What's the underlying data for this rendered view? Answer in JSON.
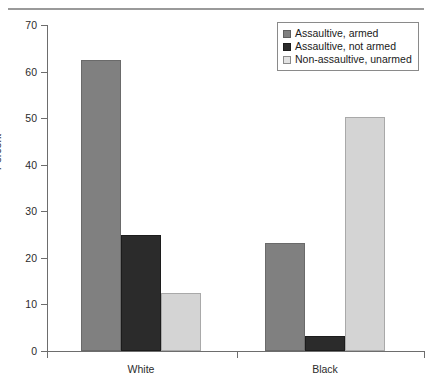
{
  "chart_data": {
    "type": "bar",
    "title": "",
    "subtitle": "",
    "xlabel": "",
    "ylabel": "Percent",
    "categories": [
      "White",
      "Black"
    ],
    "series": [
      {
        "name": "Assaultive, armed",
        "color": "#808080",
        "values": [
          62.5,
          23.3
        ]
      },
      {
        "name": "Assaultive, not armed",
        "color": "#2b2b2b",
        "values": [
          25.0,
          3.2
        ]
      },
      {
        "name": "Non-assaultive, unarmed",
        "color": "#d4d4d4",
        "values": [
          12.5,
          50.3
        ]
      }
    ],
    "ylim": [
      0,
      70
    ],
    "ytick_step": 10,
    "ytick_labels": [
      "0",
      "10",
      "20",
      "30",
      "40",
      "50",
      "60",
      "70"
    ],
    "grid": false,
    "legend_position": "top-right",
    "annotations": []
  },
  "axes": {
    "y_title": "Percent",
    "y_ticks": [
      "70",
      "60",
      "50",
      "40",
      "30",
      "20",
      "10",
      "0"
    ],
    "x_categories": [
      "White",
      "Black"
    ]
  },
  "legend": {
    "entries": [
      {
        "label": "Assaultive, armed"
      },
      {
        "label": "Assaultive, not armed"
      },
      {
        "label": "Non-assaultive, unarmed"
      }
    ]
  },
  "colors": {
    "series_armed": "#808080",
    "series_not_armed": "#2b2b2b",
    "series_unarmed": "#d4d4d4",
    "axis": "#6d6d6d",
    "rule": "#9a9a9a",
    "background": "#ffffff"
  }
}
